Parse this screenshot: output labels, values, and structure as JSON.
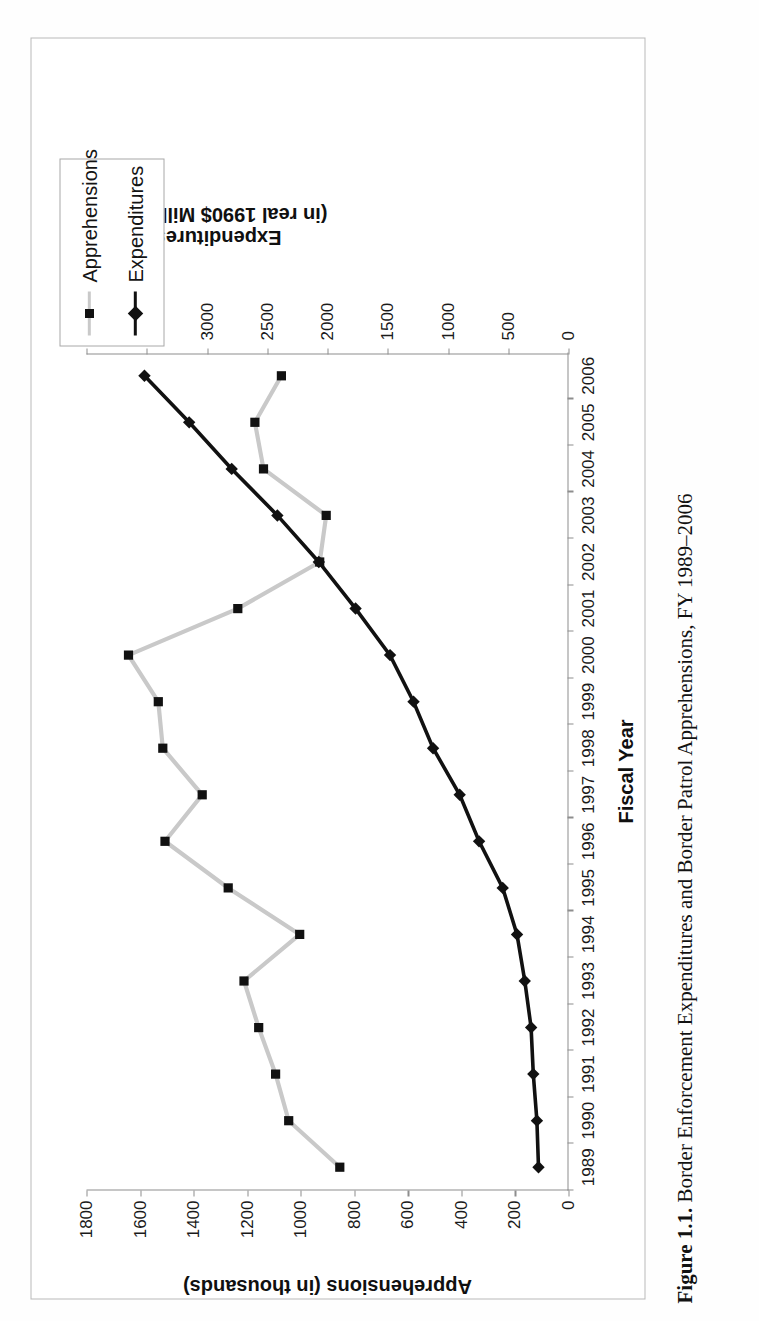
{
  "caption": {
    "figure_number": "Figure 1.1.",
    "text": " Border Enforcement Expenditures and Border Patrol Apprehensions, FY 1989–2006"
  },
  "legend": {
    "position": "top-right",
    "items": [
      {
        "label": "Apprehensions",
        "color": "#c9c9c9",
        "marker": "square"
      },
      {
        "label": "Expenditures",
        "color": "#111111",
        "marker": "diamond"
      }
    ]
  },
  "axes": {
    "left_title": "Apprehensions (in thousands)",
    "right_title_line1": "Expenditures",
    "right_title_line2": "(in real 1990$ Milliions)",
    "bottom_title": "Fiscal Year",
    "left_ticks": [
      "0",
      "200",
      "400",
      "600",
      "800",
      "1000",
      "1200",
      "1400",
      "1600",
      "1800"
    ],
    "right_ticks": [
      "0",
      "500",
      "1000",
      "1500",
      "2000",
      "2500",
      "3000",
      "3500",
      "4000"
    ],
    "bottom_ticks": [
      "1989",
      "1990",
      "1991",
      "1992",
      "1993",
      "1994",
      "1995",
      "1996",
      "1997",
      "1998",
      "1999",
      "2000",
      "2001",
      "2002",
      "2003",
      "2004",
      "2005",
      "2006"
    ]
  },
  "chart_data": {
    "type": "line",
    "title": "Border Enforcement Expenditures and Border Patrol Apprehensions, FY 1989–2006",
    "xlabel": "Fiscal Year",
    "ylabel": "Apprehensions (in thousands)",
    "y2label": "Expenditures (in real 1990$ Milliions)",
    "grid": false,
    "legend_position": "top-right",
    "x": [
      "1989",
      "1990",
      "1991",
      "1992",
      "1993",
      "1994",
      "1995",
      "1996",
      "1997",
      "1998",
      "1999",
      "2000",
      "2001",
      "2002",
      "2003",
      "2004",
      "2005",
      "2006"
    ],
    "ylim": [
      0,
      1800
    ],
    "y2lim": [
      0,
      4000
    ],
    "series": [
      {
        "name": "Apprehensions",
        "axis": "left",
        "units": "thousands",
        "color": "#c9c9c9",
        "marker": "square",
        "values": [
          854,
          1045,
          1094,
          1157,
          1212,
          1004,
          1271,
          1507,
          1368,
          1515,
          1532,
          1643,
          1235,
          929,
          905,
          1139,
          1171,
          1072
        ]
      },
      {
        "name": "Expenditures",
        "axis": "right",
        "units": "real 1990 $ millions",
        "color": "#111111",
        "marker": "diamond",
        "values": [
          249,
          262,
          292,
          310,
          363,
          427,
          546,
          742,
          903,
          1124,
          1286,
          1481,
          1767,
          2072,
          2416,
          2795,
          3148,
          3519
        ]
      }
    ]
  }
}
